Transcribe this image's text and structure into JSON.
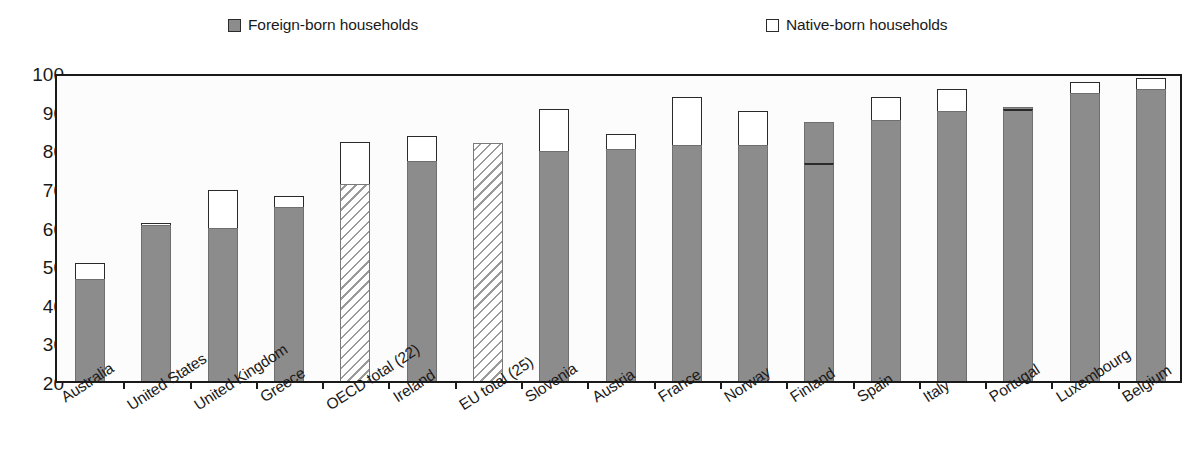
{
  "legend": {
    "foreign": {
      "label": "Foreign-born households",
      "marker": "filled-square-icon",
      "color": "#8c8c8c"
    },
    "native": {
      "label": "Native-born households",
      "marker": "hollow-square-icon",
      "color": "#ffffff"
    }
  },
  "axis": {
    "y_ticks": [
      "100",
      "90",
      "80",
      "70",
      "60",
      "50",
      "40",
      "30",
      "20"
    ]
  },
  "chart_data": {
    "type": "bar",
    "subtype": "stacked-vertical",
    "title": "",
    "xlabel": "",
    "ylabel": "",
    "ylim": [
      20,
      100
    ],
    "ytick_step": 10,
    "grid": false,
    "legend_position": "top",
    "categories": [
      "Australia",
      "United States",
      "United Kingdom",
      "Greece",
      "OECD total (22)",
      "Ireland",
      "EU total (25)",
      "Slovenia",
      "Austria",
      "France",
      "Norway",
      "Finland",
      "Spain",
      "Italy",
      "Portugal",
      "Luxembourg",
      "Belgium"
    ],
    "series": [
      {
        "name": "Foreign-born households",
        "values": [
          46.5,
          60.5,
          59.5,
          65.0,
          71.0,
          77.0,
          81.5,
          79.5,
          80.0,
          81.0,
          81.0,
          76.5,
          87.5,
          90.0,
          90.5,
          94.5,
          95.5
        ]
      },
      {
        "name": "Native-born households",
        "values": [
          50.5,
          61.0,
          69.5,
          68.0,
          82.0,
          83.5,
          81.5,
          90.5,
          84.0,
          93.5,
          90.0,
          87.0,
          93.5,
          95.5,
          91.0,
          97.5,
          98.5
        ]
      }
    ],
    "note_bar_styles": {
      "hatched": [
        "OECD total (22)",
        "EU total (25)"
      ],
      "solid_shaded_top": [
        "Finland",
        "Portugal"
      ]
    }
  }
}
